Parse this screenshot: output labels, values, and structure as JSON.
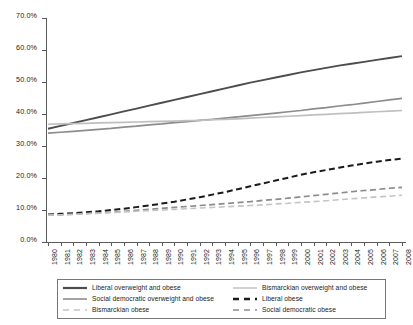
{
  "chart_data": {
    "type": "line",
    "title": "",
    "xlabel": "",
    "ylabel": "",
    "xlim": [
      1980,
      2008
    ],
    "ylim": [
      0,
      70
    ],
    "y_tick_format": "percent",
    "grid": false,
    "legend_position": "bottom",
    "y_ticks": [
      "0.0%",
      "10.0%",
      "20.0%",
      "30.0%",
      "40.0%",
      "50.0%",
      "60.0%",
      "70.0%"
    ],
    "y_tick_values": [
      0,
      10,
      20,
      30,
      40,
      50,
      60,
      70
    ],
    "x": [
      1980,
      1981,
      1982,
      1983,
      1984,
      1985,
      1986,
      1987,
      1988,
      1989,
      1990,
      1991,
      1992,
      1993,
      1994,
      1995,
      1996,
      1997,
      1998,
      1999,
      2000,
      2001,
      2002,
      2003,
      2004,
      2005,
      2006,
      2007,
      2008
    ],
    "categories": [
      "1980",
      "1981",
      "1982",
      "1983",
      "1984",
      "1985",
      "1986",
      "1987",
      "1988",
      "1989",
      "1990",
      "1991",
      "1992",
      "1993",
      "1994",
      "1995",
      "1996",
      "1997",
      "1998",
      "1999",
      "2000",
      "2001",
      "2002",
      "2003",
      "2004",
      "2005",
      "2006",
      "2007",
      "2008"
    ],
    "series": [
      {
        "name": "Liberal overweight and obese",
        "color": "#4d4d4d",
        "style": "solid",
        "width": 1.9,
        "values": [
          35.4,
          36.3,
          37.2,
          38.1,
          39.0,
          39.9,
          40.8,
          41.7,
          42.6,
          43.5,
          44.4,
          45.3,
          46.2,
          47.1,
          48.0,
          48.9,
          49.8,
          50.6,
          51.4,
          52.2,
          53.0,
          53.7,
          54.4,
          55.1,
          55.7,
          56.3,
          56.9,
          57.5,
          58.1
        ]
      },
      {
        "name": "Social democratic overweight and obese",
        "color": "#8c8c8c",
        "style": "solid",
        "width": 1.7,
        "values": [
          34.0,
          34.3,
          34.6,
          34.9,
          35.2,
          35.5,
          35.9,
          36.2,
          36.6,
          36.9,
          37.3,
          37.6,
          38.0,
          38.3,
          38.7,
          39.1,
          39.5,
          39.9,
          40.3,
          40.7,
          41.1,
          41.6,
          42.0,
          42.5,
          42.9,
          43.4,
          43.9,
          44.4,
          44.9
        ]
      },
      {
        "name": "Bismarckian overweight and obese",
        "color": "#bfbfbf",
        "style": "solid",
        "width": 1.7,
        "values": [
          36.8,
          36.9,
          37.0,
          37.1,
          37.2,
          37.3,
          37.4,
          37.5,
          37.6,
          37.7,
          37.8,
          37.9,
          38.0,
          38.2,
          38.3,
          38.5,
          38.7,
          38.9,
          39.1,
          39.3,
          39.5,
          39.7,
          39.9,
          40.1,
          40.3,
          40.5,
          40.7,
          40.9,
          41.1
        ]
      },
      {
        "name": "Liberal obese",
        "color": "#1a1a1a",
        "style": "dashed",
        "width": 2.0,
        "values": [
          8.6,
          8.8,
          9.0,
          9.3,
          9.6,
          10.0,
          10.4,
          10.9,
          11.4,
          12.0,
          12.6,
          13.3,
          14.0,
          14.8,
          15.6,
          16.5,
          17.4,
          18.3,
          19.2,
          20.1,
          21.0,
          21.8,
          22.5,
          23.2,
          23.9,
          24.5,
          25.1,
          25.6,
          26.1
        ]
      },
      {
        "name": "Social democratic obese",
        "color": "#8c8c8c",
        "style": "dashed",
        "width": 1.7,
        "values": [
          8.4,
          8.5,
          8.7,
          8.9,
          9.1,
          9.3,
          9.6,
          9.9,
          10.2,
          10.5,
          10.8,
          11.1,
          11.4,
          11.7,
          12.0,
          12.3,
          12.6,
          13.0,
          13.3,
          13.7,
          14.1,
          14.5,
          14.9,
          15.3,
          15.7,
          16.1,
          16.4,
          16.8,
          17.1
        ]
      },
      {
        "name": "Bismarckian obese",
        "color": "#c4c4c4",
        "style": "dashed",
        "width": 1.6,
        "values": [
          8.4,
          8.5,
          8.6,
          8.8,
          9.0,
          9.2,
          9.4,
          9.6,
          9.8,
          10.0,
          10.2,
          10.4,
          10.6,
          10.8,
          11.0,
          11.2,
          11.4,
          11.6,
          11.9,
          12.1,
          12.4,
          12.6,
          12.9,
          13.2,
          13.5,
          13.8,
          14.1,
          14.3,
          14.6
        ]
      }
    ]
  },
  "legend": {
    "entries": [
      {
        "label": "Liberal overweight and obese",
        "color": "#4d4d4d",
        "style": "solid",
        "width": 2.2
      },
      {
        "label": "Bismarckian overweight and obese",
        "color": "#c4c4c4",
        "style": "solid",
        "width": 1.6
      },
      {
        "label": "Social democratic overweight and obese",
        "color": "#8c8c8c",
        "style": "solid",
        "width": 1.6
      },
      {
        "label": "Liberal obese",
        "color": "#1a1a1a",
        "style": "dashed",
        "width": 2.4
      },
      {
        "label": "Bismarckian obese",
        "color": "#c4c4c4",
        "style": "dashed",
        "width": 1.6
      },
      {
        "label": "Social democratic obese",
        "color": "#8c8c8c",
        "style": "dashed",
        "width": 1.6
      }
    ]
  }
}
